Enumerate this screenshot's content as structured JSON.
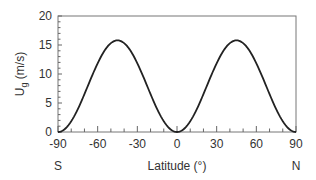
{
  "chart_data": {
    "type": "line",
    "title": "",
    "xlabel": "Latitude (°)",
    "ylabel": "U_g (m/s)",
    "ylabel_main": "U",
    "ylabel_sub": "g",
    "ylabel_unit": " (m/s)",
    "xlim": [
      -90,
      90
    ],
    "ylim": [
      0,
      20
    ],
    "xticks": [
      -90,
      -60,
      -30,
      0,
      30,
      60,
      90
    ],
    "xtick_labels": [
      "-90",
      "-60",
      "-30",
      "0",
      "30",
      "60",
      "90"
    ],
    "yticks": [
      0,
      5,
      10,
      15,
      20
    ],
    "ytick_labels": [
      "0",
      "5",
      "10",
      "15",
      "20"
    ],
    "x_end_labels": {
      "left": "S",
      "right": "N"
    },
    "grid": false,
    "legend": null,
    "series": [
      {
        "name": "U_g",
        "x": [
          -90,
          -80,
          -75,
          -70,
          -60,
          -50,
          -45,
          -40,
          -30,
          -20,
          -15,
          -10,
          0,
          10,
          15,
          20,
          30,
          40,
          45,
          50,
          60,
          70,
          75,
          80,
          90
        ],
        "values": [
          0,
          1.9,
          4.0,
          6.5,
          11.9,
          15.3,
          15.8,
          15.3,
          11.9,
          6.5,
          4.0,
          1.9,
          0,
          1.9,
          4.0,
          6.5,
          11.9,
          15.3,
          15.8,
          15.3,
          11.9,
          6.5,
          4.0,
          1.9,
          0
        ]
      }
    ],
    "peak": {
      "value": 15.8,
      "at": [
        -45,
        45
      ]
    }
  }
}
